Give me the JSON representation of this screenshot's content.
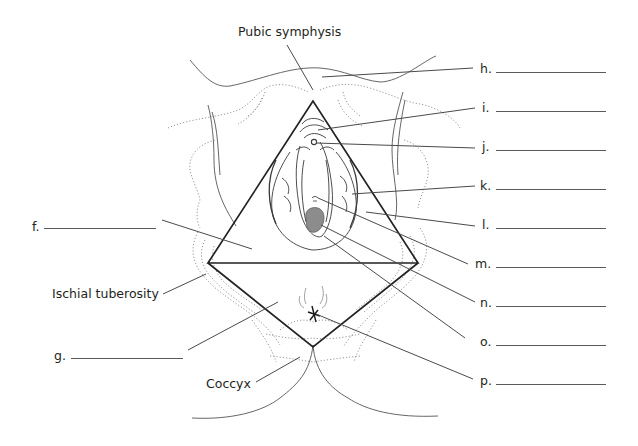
{
  "diagram": {
    "type": "anatomical labeling worksheet",
    "landmark_labels": {
      "pubic_symphysis": "Pubic symphysis",
      "ischial_tuberosity": "Ischial tuberosity",
      "coccyx": "Coccyx"
    },
    "blanks": [
      {
        "letter": "f.",
        "side": "left"
      },
      {
        "letter": "g.",
        "side": "left"
      },
      {
        "letter": "h.",
        "side": "right"
      },
      {
        "letter": "i.",
        "side": "right"
      },
      {
        "letter": "j.",
        "side": "right"
      },
      {
        "letter": "k.",
        "side": "right"
      },
      {
        "letter": "l.",
        "side": "right"
      },
      {
        "letter": "m.",
        "side": "right"
      },
      {
        "letter": "n.",
        "side": "right"
      },
      {
        "letter": "o.",
        "side": "right"
      },
      {
        "letter": "p.",
        "side": "right"
      }
    ],
    "colors": {
      "ink": "#231f20",
      "leader": "#4a4a4a",
      "dotted": "#8a8a8a",
      "lesion": "#7a7a7a"
    }
  }
}
